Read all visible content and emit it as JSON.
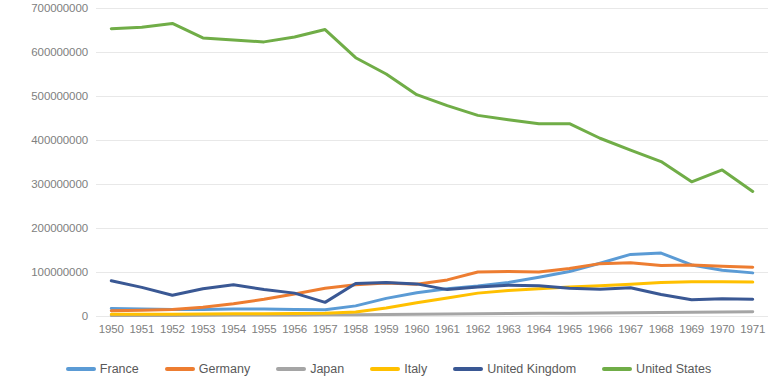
{
  "chart_data": {
    "type": "line",
    "title": "",
    "subtitle": "",
    "xlabel": "",
    "ylabel": "",
    "grid": true,
    "legend_position": "bottom",
    "ylim": [
      0,
      700000000
    ],
    "y_ticks": [
      0,
      100000000,
      200000000,
      300000000,
      400000000,
      500000000,
      600000000,
      700000000
    ],
    "y_tick_labels": [
      "0",
      "100000000",
      "200000000",
      "300000000",
      "400000000",
      "500000000",
      "600000000",
      "700000000"
    ],
    "categories": [
      "1950",
      "1951",
      "1952",
      "1953",
      "1954",
      "1955",
      "1956",
      "1957",
      "1958",
      "1959",
      "1960",
      "1961",
      "1962",
      "1963",
      "1964",
      "1965",
      "1966",
      "1967",
      "1968",
      "1969",
      "1970",
      "1971"
    ],
    "series": [
      {
        "name": "France",
        "color": "#5B9BD5",
        "values": [
          17000000,
          16000000,
          15000000,
          15000000,
          16000000,
          16000000,
          15000000,
          14000000,
          23000000,
          40000000,
          53000000,
          62000000,
          68000000,
          76000000,
          88000000,
          101000000,
          120000000,
          140000000,
          143000000,
          116000000,
          104000000,
          98000000
        ]
      },
      {
        "name": "Germany",
        "color": "#ED7D31",
        "values": [
          12000000,
          13000000,
          15000000,
          20000000,
          28000000,
          38000000,
          50000000,
          63000000,
          71000000,
          75000000,
          72000000,
          82000000,
          100000000,
          101000000,
          100000000,
          108000000,
          119000000,
          121000000,
          115000000,
          116000000,
          113000000,
          111000000
        ]
      },
      {
        "name": "Japan",
        "color": "#A5A5A5",
        "values": [
          1000000,
          1000000,
          1000000,
          1500000,
          2000000,
          2000000,
          2500000,
          3000000,
          3000000,
          3500000,
          4000000,
          4500000,
          5000000,
          5500000,
          6000000,
          6500000,
          7000000,
          7500000,
          8000000,
          8500000,
          9000000,
          9500000
        ]
      },
      {
        "name": "Italy",
        "color": "#FFC000",
        "values": [
          4000000,
          4000000,
          4000000,
          4500000,
          5000000,
          5000000,
          5500000,
          6000000,
          9000000,
          18000000,
          30000000,
          41000000,
          52000000,
          58000000,
          62000000,
          66000000,
          69000000,
          72000000,
          76000000,
          78000000,
          78000000,
          77000000
        ]
      },
      {
        "name": "United Kingdom",
        "color": "#3A5894",
        "values": [
          80000000,
          65000000,
          47000000,
          62000000,
          71000000,
          60000000,
          52000000,
          31000000,
          74000000,
          76000000,
          73000000,
          60000000,
          66000000,
          70000000,
          69000000,
          63000000,
          61000000,
          64000000,
          49000000,
          37000000,
          39000000,
          38000000
        ]
      },
      {
        "name": "United States",
        "color": "#70AD47",
        "values": [
          653000000,
          656000000,
          665000000,
          632000000,
          627000000,
          623000000,
          634000000,
          651000000,
          587000000,
          550000000,
          503000000,
          478000000,
          456000000,
          446000000,
          437000000,
          437000000,
          404000000,
          377000000,
          351000000,
          305000000,
          332000000,
          283000000
        ]
      }
    ]
  },
  "legend": {
    "items": [
      {
        "label": "France",
        "color": "#5B9BD5",
        "swatch_name": "legend-swatch-france"
      },
      {
        "label": "Germany",
        "color": "#ED7D31",
        "swatch_name": "legend-swatch-germany"
      },
      {
        "label": "Japan",
        "color": "#A5A5A5",
        "swatch_name": "legend-swatch-japan"
      },
      {
        "label": "Italy",
        "color": "#FFC000",
        "swatch_name": "legend-swatch-italy"
      },
      {
        "label": "United Kingdom",
        "color": "#3A5894",
        "swatch_name": "legend-swatch-united-kingdom"
      },
      {
        "label": "United States",
        "color": "#70AD47",
        "swatch_name": "legend-swatch-united-states"
      }
    ]
  },
  "style": {
    "background": "#FFFFFF",
    "gridline_color": "#E8E8E8",
    "axis_text_color": "#808080",
    "legend_text_color": "#595959",
    "line_width": 3
  }
}
